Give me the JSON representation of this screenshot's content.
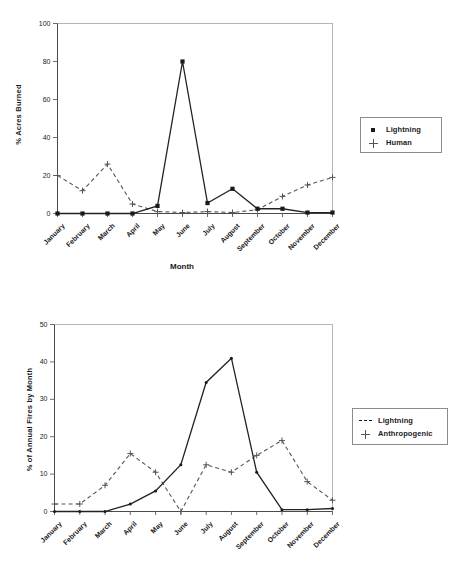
{
  "chart_data": [
    {
      "type": "line",
      "title": "",
      "xlabel": "Month",
      "ylabel": "% Acres Burned",
      "categories": [
        "January",
        "February",
        "March",
        "April",
        "May",
        "June",
        "July",
        "August",
        "September",
        "October",
        "November",
        "December"
      ],
      "ylim": [
        0,
        100
      ],
      "yticks": [
        0,
        20,
        40,
        60,
        80,
        100
      ],
      "grid": false,
      "legend_position": "right",
      "series": [
        {
          "name": "Lightning",
          "marker": "filled-square",
          "line": "solid",
          "values": [
            0,
            0,
            0,
            0,
            4,
            80,
            5.5,
            13,
            2.5,
            2.5,
            0.5,
            0.5
          ]
        },
        {
          "name": "Human",
          "marker": "plus",
          "line": "dashed",
          "values": [
            20,
            12,
            26,
            5,
            1,
            0.5,
            1,
            0.5,
            2,
            9,
            15,
            19
          ]
        }
      ]
    },
    {
      "type": "line",
      "title": "",
      "xlabel": "",
      "ylabel": "% of Annual Fires by Month",
      "categories": [
        "January",
        "February",
        "March",
        "April",
        "May",
        "June",
        "July",
        "August",
        "September",
        "October",
        "November",
        "December"
      ],
      "ylim": [
        0,
        50
      ],
      "yticks": [
        0,
        10,
        20,
        30,
        40,
        50
      ],
      "grid": false,
      "legend_position": "right",
      "series": [
        {
          "name": "Lightning",
          "marker": "small-dash",
          "line": "solid",
          "values": [
            0,
            0,
            0,
            2,
            5.5,
            12.5,
            34.5,
            41,
            10.5,
            0.5,
            0.5,
            0.8
          ]
        },
        {
          "name": "Anthropogenic",
          "marker": "plus",
          "line": "dashed",
          "values": [
            2,
            2,
            7,
            15.5,
            10.5,
            0,
            12.5,
            10.5,
            15,
            19,
            8,
            3
          ]
        }
      ]
    }
  ],
  "top_chart": {
    "ylabel": "% Acres Burned",
    "xlabel": "Month",
    "yticks": [
      "0",
      "20",
      "40",
      "60",
      "80",
      "100"
    ],
    "xticks": [
      "January",
      "February",
      "March",
      "April",
      "May",
      "June",
      "July",
      "August",
      "September",
      "October",
      "November",
      "December"
    ],
    "legend": {
      "items": [
        {
          "label": "Lightning",
          "key": "filled-square-marker"
        },
        {
          "label": "Human",
          "key": "plus-marker"
        }
      ]
    }
  },
  "bottom_chart": {
    "ylabel": "% of Annual Fires by Month",
    "xlabel": "",
    "yticks": [
      "0",
      "10",
      "20",
      "30",
      "40",
      "50"
    ],
    "xticks": [
      "January",
      "February",
      "March",
      "April",
      "May",
      "June",
      "July",
      "August",
      "September",
      "October",
      "November",
      "December"
    ],
    "legend": {
      "items": [
        {
          "label": "Lightning",
          "key": "dash-marker"
        },
        {
          "label": "Anthropogenic",
          "key": "plus-marker"
        }
      ]
    }
  }
}
